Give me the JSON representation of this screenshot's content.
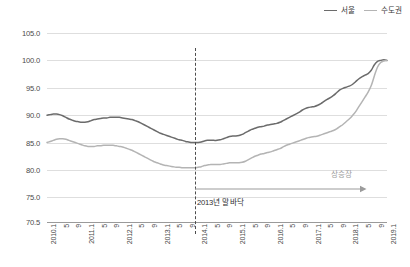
{
  "legend": {
    "position": "top-right",
    "entries": [
      {
        "label": "서울",
        "color": "#6b6b6b"
      },
      {
        "label": "수도권",
        "color": "#b4b4b4"
      }
    ]
  },
  "annotations": {
    "trough": {
      "label": "2013년 말 바닥",
      "x_category": "2013.12"
    },
    "uptrend": {
      "label": "상승장",
      "from_category": "2013.12",
      "to_category": "2019.1",
      "color": "#9b9b9b"
    }
  },
  "chart_data": {
    "type": "line",
    "title": "",
    "subtitle": "",
    "xlabel": "",
    "ylabel": "",
    "ylim": [
      70.5,
      105.0
    ],
    "yticks": [
      "105.0",
      "100.0",
      "95.0",
      "90.0",
      "85.0",
      "80.0",
      "75.0",
      "70.5"
    ],
    "ytick_values": [
      105.0,
      100.0,
      95.0,
      90.0,
      85.0,
      80.0,
      75.0,
      70.5
    ],
    "grid": true,
    "legend_position": "top-right",
    "categories": [
      "2010.1",
      "2010.2",
      "2010.3",
      "2010.4",
      "2010.5",
      "2010.6",
      "2010.7",
      "2010.8",
      "2010.9",
      "2010.10",
      "2010.11",
      "2010.12",
      "2011.1",
      "2011.2",
      "2011.3",
      "2011.4",
      "2011.5",
      "2011.6",
      "2011.7",
      "2011.8",
      "2011.9",
      "2011.10",
      "2011.11",
      "2011.12",
      "2012.1",
      "2012.2",
      "2012.3",
      "2012.4",
      "2012.5",
      "2012.6",
      "2012.7",
      "2012.8",
      "2012.9",
      "2012.10",
      "2012.11",
      "2012.12",
      "2013.1",
      "2013.2",
      "2013.3",
      "2013.4",
      "2013.5",
      "2013.6",
      "2013.7",
      "2013.8",
      "2013.9",
      "2013.10",
      "2013.11",
      "2013.12",
      "2014.1",
      "2014.2",
      "2014.3",
      "2014.4",
      "2014.5",
      "2014.6",
      "2014.7",
      "2014.8",
      "2014.9",
      "2014.10",
      "2014.11",
      "2014.12",
      "2015.1",
      "2015.2",
      "2015.3",
      "2015.4",
      "2015.5",
      "2015.6",
      "2015.7",
      "2015.8",
      "2015.9",
      "2015.10",
      "2015.11",
      "2015.12",
      "2016.1",
      "2016.2",
      "2016.3",
      "2016.4",
      "2016.5",
      "2016.6",
      "2016.7",
      "2016.8",
      "2016.9",
      "2016.10",
      "2016.11",
      "2016.12",
      "2017.1",
      "2017.2",
      "2017.3",
      "2017.4",
      "2017.5",
      "2017.6",
      "2017.7",
      "2017.8",
      "2017.9",
      "2017.10",
      "2017.11",
      "2017.12",
      "2018.1",
      "2018.2",
      "2018.3",
      "2018.4",
      "2018.5",
      "2018.6",
      "2018.7",
      "2018.8",
      "2018.9",
      "2018.10",
      "2018.11",
      "2018.12",
      "2019.1"
    ],
    "xtick_labels": [
      {
        "category": "2010.1",
        "label": "2010.1"
      },
      {
        "category": "2010.5",
        "label": "5"
      },
      {
        "category": "2010.9",
        "label": "9"
      },
      {
        "category": "2011.1",
        "label": "2011.1"
      },
      {
        "category": "2011.5",
        "label": "5"
      },
      {
        "category": "2011.9",
        "label": "9"
      },
      {
        "category": "2012.1",
        "label": "2012.1"
      },
      {
        "category": "2012.5",
        "label": "5"
      },
      {
        "category": "2012.9",
        "label": "9"
      },
      {
        "category": "2013.1",
        "label": "2013.1"
      },
      {
        "category": "2013.5",
        "label": "5"
      },
      {
        "category": "2013.9",
        "label": "9"
      },
      {
        "category": "2014.1",
        "label": "2014.1"
      },
      {
        "category": "2014.5",
        "label": "5"
      },
      {
        "category": "2014.9",
        "label": "9"
      },
      {
        "category": "2015.1",
        "label": "2015.1"
      },
      {
        "category": "2015.5",
        "label": "5"
      },
      {
        "category": "2015.9",
        "label": "9"
      },
      {
        "category": "2016.1",
        "label": "2016.1"
      },
      {
        "category": "2016.5",
        "label": "5"
      },
      {
        "category": "2016.9",
        "label": "9"
      },
      {
        "category": "2017.1",
        "label": "2017.1"
      },
      {
        "category": "2017.5",
        "label": "5"
      },
      {
        "category": "2017.9",
        "label": "9"
      },
      {
        "category": "2018.1",
        "label": "2018.1"
      },
      {
        "category": "2018.5",
        "label": "5"
      },
      {
        "category": "2018.9",
        "label": "9"
      },
      {
        "category": "2019.1",
        "label": "2019.1"
      }
    ],
    "series": [
      {
        "name": "서울",
        "color": "#6b6b6b",
        "values": [
          90.0,
          90.1,
          90.2,
          90.2,
          90.1,
          89.9,
          89.6,
          89.3,
          89.1,
          88.9,
          88.8,
          88.7,
          88.7,
          88.8,
          89.0,
          89.2,
          89.3,
          89.4,
          89.5,
          89.5,
          89.6,
          89.6,
          89.6,
          89.6,
          89.5,
          89.4,
          89.3,
          89.2,
          89.0,
          88.8,
          88.5,
          88.2,
          87.9,
          87.6,
          87.3,
          87.0,
          86.7,
          86.5,
          86.3,
          86.1,
          85.9,
          85.7,
          85.5,
          85.4,
          85.2,
          85.1,
          85.0,
          85.0,
          85.0,
          85.1,
          85.3,
          85.4,
          85.4,
          85.4,
          85.4,
          85.5,
          85.7,
          85.9,
          86.1,
          86.2,
          86.2,
          86.3,
          86.5,
          86.8,
          87.1,
          87.4,
          87.6,
          87.8,
          87.9,
          88.0,
          88.2,
          88.3,
          88.4,
          88.5,
          88.7,
          89.0,
          89.3,
          89.6,
          89.9,
          90.2,
          90.5,
          90.9,
          91.2,
          91.4,
          91.5,
          91.6,
          91.8,
          92.1,
          92.5,
          92.9,
          93.2,
          93.6,
          94.1,
          94.6,
          94.9,
          95.1,
          95.3,
          95.6,
          96.1,
          96.6,
          97.0,
          97.3,
          97.6,
          98.2,
          99.2,
          99.8,
          100.0,
          100.1,
          100.0
        ]
      },
      {
        "name": "수도권",
        "color": "#b4b4b4",
        "values": [
          85.0,
          85.2,
          85.4,
          85.6,
          85.7,
          85.7,
          85.6,
          85.4,
          85.2,
          85.0,
          84.8,
          84.6,
          84.4,
          84.3,
          84.3,
          84.3,
          84.4,
          84.4,
          84.5,
          84.5,
          84.5,
          84.5,
          84.4,
          84.3,
          84.2,
          84.0,
          83.8,
          83.6,
          83.3,
          83.0,
          82.7,
          82.4,
          82.1,
          81.8,
          81.5,
          81.3,
          81.1,
          80.9,
          80.8,
          80.7,
          80.6,
          80.5,
          80.5,
          80.4,
          80.4,
          80.4,
          80.4,
          80.4,
          80.5,
          80.6,
          80.8,
          80.9,
          81.0,
          81.0,
          81.0,
          81.0,
          81.1,
          81.2,
          81.3,
          81.3,
          81.3,
          81.3,
          81.4,
          81.6,
          81.9,
          82.2,
          82.5,
          82.7,
          82.9,
          83.0,
          83.2,
          83.3,
          83.5,
          83.7,
          83.9,
          84.2,
          84.5,
          84.7,
          84.9,
          85.1,
          85.3,
          85.5,
          85.7,
          85.9,
          86.0,
          86.1,
          86.2,
          86.4,
          86.6,
          86.8,
          87.0,
          87.2,
          87.5,
          87.9,
          88.3,
          88.8,
          89.3,
          89.9,
          90.6,
          91.5,
          92.4,
          93.3,
          94.2,
          95.4,
          97.2,
          98.8,
          99.6,
          99.9,
          100.0
        ]
      }
    ]
  }
}
